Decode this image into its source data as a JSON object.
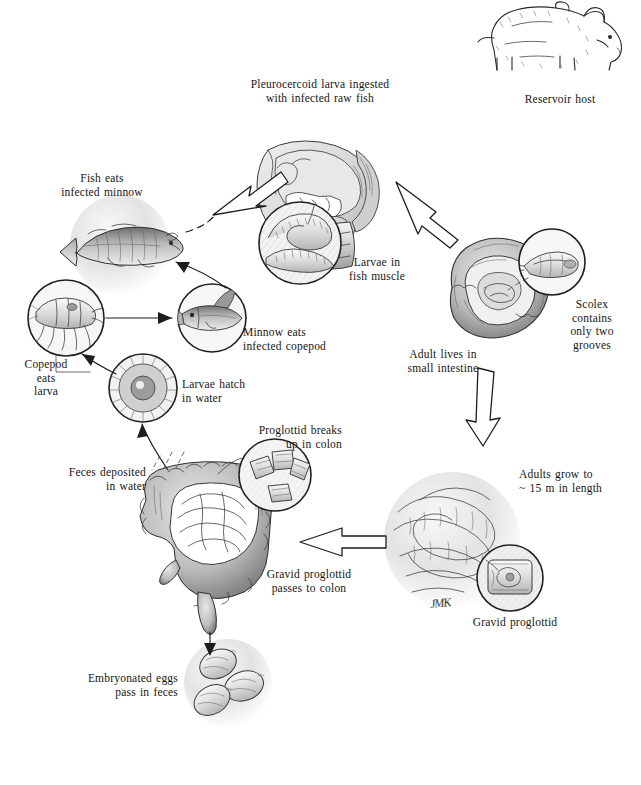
{
  "diagram": {
    "signature": "JMK",
    "labels": {
      "pleurocercoid": "Pleurocercoid larva ingested\nwith infected raw fish",
      "reservoir_host": "Reservoir host",
      "fish_eats_minnow": "Fish eats\ninfected minnow",
      "larvae_fish_muscle": "Larvae in\nfish muscle",
      "scolex": "Scolex\ncontains\nonly two\ngrooves",
      "adult_small_intestine": "Adult lives in\nsmall intestine",
      "minnow_eats_copepod": "Minnow eats\ninfected copepod",
      "copepod_eats_larva": "Copepod\neats\nlarva",
      "larvae_hatch": "Larvae hatch\nin water",
      "feces_deposited": "Feces deposited\nin water",
      "proglottid_breaks": "Proglottid breaks\nup in colon",
      "adults_grow": "Adults grow to\n~ 15 m in length",
      "gravid_passes": "Gravid proglottid\npasses to colon",
      "gravid_proglottid": "Gravid proglottid",
      "embryonated_eggs": "Embryonated eggs\npass in feces"
    },
    "illustrations": {
      "bear": "bear-illustration",
      "human_head": "human-head-sagittal-illustration",
      "larvae_inset": "larvae-in-fish-muscle-inset",
      "large_fish": "large-fish-illustration",
      "copepod": "copepod-inset",
      "minnow": "minnow-inset",
      "coracidium": "coracidium-larva-inset",
      "intestine": "human-intestine-illustration",
      "proglottid_fragments": "proglottid-fragments-inset",
      "scolex": "scolex-inset",
      "adult_worm": "adult-tapeworm-illustration",
      "gravid_proglottid": "gravid-proglottid-inset",
      "eggs": "embryonated-eggs-illustration",
      "bowel_cross_section": "small-intestine-cross-section"
    },
    "colors": {
      "ink": "#1d1d1d",
      "paper": "#ffffff",
      "wash_light": "#f0f0f0",
      "wash_mid": "#c9c9c9",
      "wash_dark": "#8e8e8e"
    }
  }
}
